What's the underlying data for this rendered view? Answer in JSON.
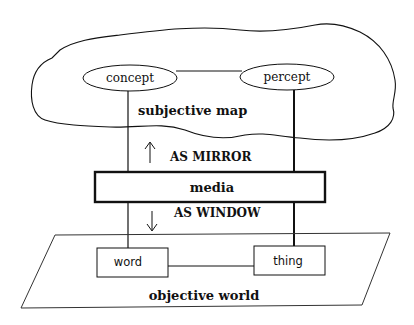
{
  "diagram": {
    "cloud": {
      "label": "subjective map",
      "nodes": [
        {
          "id": "concept",
          "label": "concept",
          "shape": "ellipse"
        },
        {
          "id": "percept",
          "label": "percept",
          "shape": "ellipse"
        }
      ]
    },
    "media": {
      "label": "media",
      "upper_label": "AS MIRROR",
      "upper_arrow": "up-arrow",
      "lower_label": "AS WINDOW",
      "lower_arrow": "down-arrow"
    },
    "plane": {
      "label": "objective world",
      "nodes": [
        {
          "id": "word",
          "label": "word",
          "shape": "rectangle"
        },
        {
          "id": "thing",
          "label": "thing",
          "shape": "rectangle"
        }
      ]
    },
    "edges": [
      {
        "from": "concept",
        "to": "percept"
      },
      {
        "from": "word",
        "to": "thing"
      },
      {
        "from": "concept",
        "to": "word"
      },
      {
        "from": "percept",
        "to": "thing"
      }
    ],
    "colors": {
      "stroke": "#111111",
      "background": "#ffffff"
    }
  }
}
